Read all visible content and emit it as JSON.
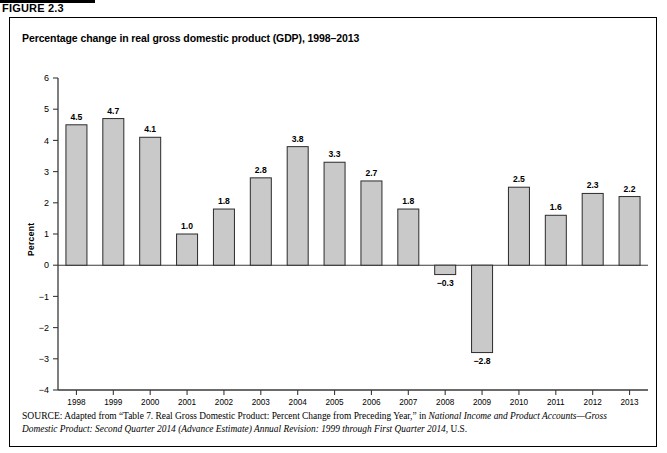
{
  "figure": {
    "number_label": "FIGURE 2.3",
    "title": "Percentage change in real gross domestic product (GDP), 1998–2013"
  },
  "chart_data": {
    "type": "bar",
    "title": "Percentage change in real gross domestic product (GDP), 1998–2013",
    "xlabel": "",
    "ylabel": "Percent",
    "categories": [
      "1998",
      "1999",
      "2000",
      "2001",
      "2002",
      "2003",
      "2004",
      "2005",
      "2006",
      "2007",
      "2008",
      "2009",
      "2010",
      "2011",
      "2012",
      "2013"
    ],
    "values": [
      4.5,
      4.7,
      4.1,
      1.0,
      1.8,
      2.8,
      3.8,
      3.3,
      2.7,
      1.8,
      -0.3,
      -2.8,
      2.5,
      1.6,
      2.3,
      2.2
    ],
    "value_labels": [
      "4.5",
      "4.7",
      "4.1",
      "1.0",
      "1.8",
      "2.8",
      "3.8",
      "3.3",
      "2.7",
      "1.8",
      "−0.3",
      "−2.8",
      "2.5",
      "1.6",
      "2.3",
      "2.2"
    ],
    "ylim": [
      -4,
      6
    ],
    "yticks": [
      6,
      5,
      4,
      3,
      2,
      1,
      0,
      -1,
      -2,
      -3,
      -4
    ],
    "ytick_labels": [
      "6",
      "5",
      "4",
      "3",
      "2",
      "1",
      "0",
      "−1",
      "−2",
      "−3",
      "−4"
    ],
    "grid": false,
    "legend": null,
    "bar_fill": "#c9c9c9",
    "bar_stroke": "#2b2b2b"
  },
  "source": {
    "prefix": "SOURCE",
    "text_part1": ": Adapted from “Table 7. Real Gross Domestic Product: Percent Change from Preceding Year,” in ",
    "italic1": "National Income and Product Accounts—Gross Domestic Product: Second Quarter 2014 (Advance Estimate) Annual Revision: 1999 through First Quarter 2014",
    "text_part2": ", U.S."
  }
}
